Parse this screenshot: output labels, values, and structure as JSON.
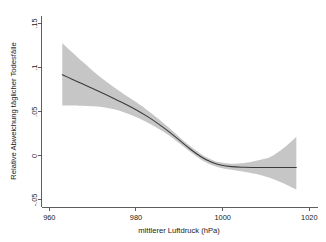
{
  "chart_data": {
    "type": "line",
    "title": "",
    "subtitle": "",
    "xlabel": "mittlerer Luftdruck (hPa)",
    "ylabel": "Relative Abweichung täglicher Todesfälle",
    "xlim": [
      958.2,
      1022.0
    ],
    "ylim": [
      -0.0585,
      0.1585
    ],
    "grid": false,
    "legend": false,
    "legend_position": "none",
    "xticks": [
      960,
      980,
      1000,
      1020
    ],
    "xticklabels": [
      "960",
      "980",
      "1000",
      "1020"
    ],
    "yticks": [
      -0.05,
      0,
      0.05,
      0.1,
      0.15
    ],
    "yticklabels": [
      "-.05",
      "0",
      ".05",
      ".1",
      ".15"
    ],
    "series": [
      {
        "name": "fit",
        "kind": "line",
        "color": "#3a3a3a",
        "x": [
          963.0,
          965.0,
          967.5,
          970.0,
          972.5,
          975.0,
          977.5,
          980.0,
          982.5,
          985.0,
          987.5,
          990.0,
          992.5,
          995.0,
          997.0,
          999.0,
          1002.0,
          1005.0,
          1008.0,
          1011.0,
          1014.0,
          1017.0
        ],
        "values": [
          0.092,
          0.0875,
          0.0819,
          0.0763,
          0.0706,
          0.0648,
          0.0588,
          0.0523,
          0.045,
          0.0369,
          0.0278,
          0.0178,
          0.0078,
          -0.001,
          -0.0062,
          -0.0098,
          -0.0122,
          -0.0129,
          -0.0131,
          -0.0131,
          -0.0131,
          -0.0131
        ]
      },
      {
        "name": "95% Konfidenzintervall",
        "kind": "band",
        "color": "#c3c3c3",
        "x": [
          963.0,
          965.0,
          967.5,
          970.0,
          972.5,
          975.0,
          977.5,
          980.0,
          982.5,
          985.0,
          987.5,
          990.0,
          992.5,
          995.0,
          997.0,
          999.0,
          1002.0,
          1005.0,
          1008.0,
          1011.0,
          1014.0,
          1017.0
        ],
        "upper": [
          0.128,
          0.1186,
          0.1074,
          0.0966,
          0.0866,
          0.0775,
          0.0691,
          0.061,
          0.0522,
          0.0426,
          0.0323,
          0.0215,
          0.0112,
          0.0022,
          -0.0032,
          -0.007,
          -0.0088,
          -0.008,
          -0.0052,
          -0.0013,
          0.0085,
          0.0218
        ],
        "lower": [
          0.0572,
          0.057,
          0.0567,
          0.0562,
          0.0552,
          0.0527,
          0.0489,
          0.044,
          0.0381,
          0.0314,
          0.0236,
          0.0144,
          0.0046,
          -0.0042,
          -0.0094,
          -0.0128,
          -0.0158,
          -0.018,
          -0.0209,
          -0.025,
          -0.031,
          -0.0382
        ]
      }
    ]
  }
}
